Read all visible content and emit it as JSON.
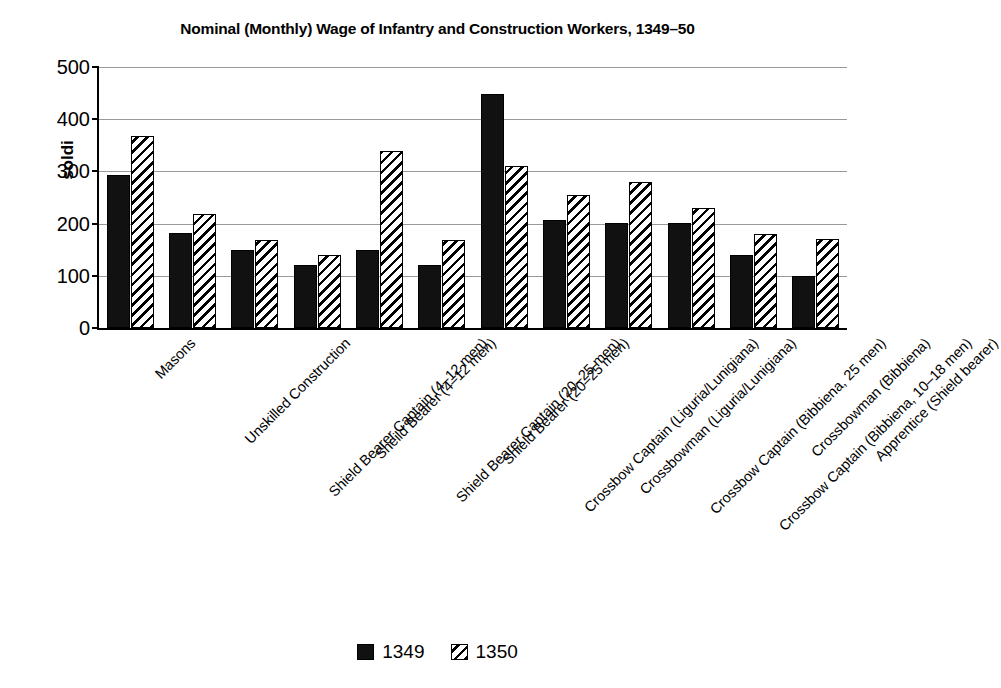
{
  "chart_data": {
    "type": "bar",
    "title": "Nominal (Monthly) Wage of Infantry and Construction Workers, 1349–50",
    "xlabel": "",
    "ylabel": "soldi",
    "ylim": [
      0,
      500
    ],
    "yticks": [
      0,
      100,
      200,
      300,
      400,
      500
    ],
    "ytick_labels": [
      "0",
      "100",
      "200",
      "300",
      "400",
      "500"
    ],
    "grid": true,
    "legend_position": "bottom",
    "categories": [
      "Masons",
      "Unskilled Construction",
      "Shield Bearer Captain (4–12 men)",
      "Sheild Bearer (4–12 men)",
      "Shield Bearer Captain (20–25 men)",
      "Shield Bearer (20–25 men)",
      "Crossbow Captain (Liguria/Lunigiana)",
      "Crossbowman (Liguria/Lunigiana)",
      "Crossbow Captain (Bibbiena, 25 men)",
      "Crossbow Captain (Bibbiena, 10–18 men)",
      "Crossbowman (Bibbiena)",
      "Apprentice (Shield bearer)"
    ],
    "series": [
      {
        "name": "1349",
        "color": "#111111",
        "pattern": "solid",
        "values": [
          293,
          182,
          150,
          121,
          150,
          120,
          448,
          206,
          202,
          202,
          139,
          100
        ]
      },
      {
        "name": "1350",
        "color": "#ffffff",
        "pattern": "diagonal-hatch",
        "values": [
          368,
          218,
          169,
          140,
          340,
          169,
          311,
          255,
          279,
          230,
          181,
          170
        ]
      }
    ]
  },
  "legend": {
    "items": [
      {
        "label": "1349",
        "swatch": "solid-black-square"
      },
      {
        "label": "1350",
        "swatch": "hatched-square"
      }
    ]
  }
}
